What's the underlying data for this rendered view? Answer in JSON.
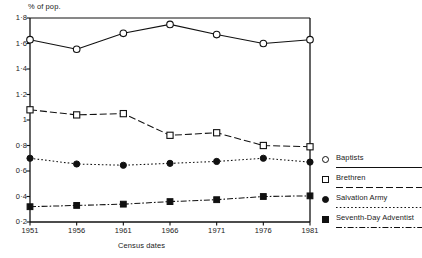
{
  "chart_data": {
    "type": "line",
    "title": "",
    "xlabel": "Census dates",
    "ylabel": "% of pop.",
    "grid": false,
    "legend_position": "right",
    "categories": [
      "1951",
      "1956",
      "1961",
      "1966",
      "1971",
      "1976",
      "1981"
    ],
    "x": [
      1951,
      1956,
      1961,
      1966,
      1971,
      1976,
      1981
    ],
    "xlim": [
      1951,
      1981
    ],
    "ylim": [
      0.2,
      1.8
    ],
    "ytick_labels": [
      "0·2",
      "0·4",
      "0·6",
      "0·8",
      "1",
      "1·2",
      "1·4",
      "1·6",
      "1·8"
    ],
    "ytick_values": [
      0.2,
      0.4,
      0.6,
      0.8,
      1.0,
      1.2,
      1.4,
      1.6,
      1.8
    ],
    "series": [
      {
        "name": "Baptists",
        "marker": "open-circle",
        "line_style": "solid",
        "values": [
          1.63,
          1.555,
          1.68,
          1.75,
          1.67,
          1.6,
          1.63
        ]
      },
      {
        "name": "Brethren",
        "marker": "open-square",
        "line_style": "long-dash",
        "values": [
          1.08,
          1.04,
          1.05,
          0.88,
          0.9,
          0.8,
          0.79
        ]
      },
      {
        "name": "Salvation Army",
        "marker": "filled-circle",
        "line_style": "dotted",
        "values": [
          0.7,
          0.655,
          0.645,
          0.66,
          0.675,
          0.7,
          0.67
        ]
      },
      {
        "name": "Seventh-Day Adventist",
        "marker": "filled-square",
        "line_style": "dash-dot",
        "values": [
          0.32,
          0.33,
          0.34,
          0.36,
          0.375,
          0.4,
          0.405
        ]
      }
    ]
  },
  "legend": {
    "items": [
      {
        "label": "Baptists",
        "marker": "open-circle",
        "line_style": "solid"
      },
      {
        "label": "Brethren",
        "marker": "open-square",
        "line_style": "long-dash"
      },
      {
        "label": "Salvation Army",
        "marker": "filled-circle",
        "line_style": "dotted"
      },
      {
        "label": "Seventh-Day Adventist",
        "marker": "filled-square",
        "line_style": "dash-dot"
      }
    ]
  },
  "colors": {
    "ink": "#111111",
    "background": "#ffffff"
  }
}
